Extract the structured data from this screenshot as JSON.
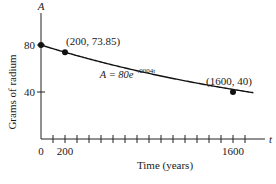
{
  "chart_data": {
    "type": "line",
    "title": "",
    "xlabel": "Time (years)",
    "ylabel": "Grams of radium",
    "x_axis_var": "t",
    "y_axis_var": "A",
    "xlim": [
      0,
      1800
    ],
    "ylim": [
      0,
      100
    ],
    "x_tick_interval": 100,
    "x_tick_labels": [
      {
        "value": 0,
        "label": "0"
      },
      {
        "value": 200,
        "label": "200"
      },
      {
        "value": 1600,
        "label": "1600"
      }
    ],
    "y_tick_labels": [
      {
        "value": 40,
        "label": "40"
      },
      {
        "value": 80,
        "label": "80"
      }
    ],
    "series": [
      {
        "name": "A = 80e^(-0.0004t)",
        "function": {
          "a": 80,
          "k": -0.0004
        },
        "x_range": [
          0,
          1770
        ]
      }
    ],
    "points": [
      {
        "x": 0,
        "y": 80,
        "label": ""
      },
      {
        "x": 200,
        "y": 73.85,
        "label": "(200, 73.85)"
      },
      {
        "x": 1600,
        "y": 40,
        "label": "(1600, 40)"
      }
    ],
    "annotations": [
      {
        "text_main": "A = 80e",
        "text_sup": "−.0004t",
        "x": 490,
        "y": 52
      }
    ],
    "grid": false,
    "legend": "none"
  }
}
